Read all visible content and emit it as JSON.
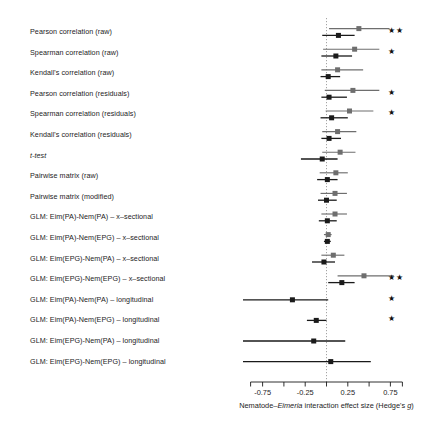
{
  "figure": {
    "xlabel_parts": [
      "Nematode–",
      "Eimeria",
      " interaction effect size (Hedge's ",
      "g",
      ")"
    ],
    "xlabel_full": "Nematode–Eimeria interaction effect size (Hedge's g)",
    "zero_line_value": 0,
    "series_colors": {
      "primary": "#1a1a1a",
      "secondary": "#6e6e6e"
    },
    "significance_glyph": "★"
  },
  "chart_data": {
    "type": "forest",
    "title": "",
    "xlabel": "Nematode–Eimeria interaction effect size (Hedge's g)",
    "ylabel": "",
    "xlim": [
      -0.98,
      0.98
    ],
    "xticks": [
      -0.75,
      -0.5,
      -0.25,
      0,
      0.25,
      0.5,
      0.75
    ],
    "xticklabels": [
      "-0.75",
      "",
      "-0.25",
      "",
      "0.25",
      "",
      "0.75"
    ],
    "grid": false,
    "zero_reference": 0,
    "legend": "none",
    "series": [
      {
        "name": "model A",
        "color": "#6e6e6e"
      },
      {
        "name": "model B",
        "color": "#1a1a1a"
      }
    ],
    "categories": [
      "Pearson correlation (raw)",
      "Spearman correlation (raw)",
      "Kendall's correlation (raw)",
      "Pearson correlation (residuals)",
      "Spearman correlation (residuals)",
      "Kendall's correlation (residuals)",
      "t-test",
      "Pairwise matrix (raw)",
      "Pairwise matrix (modified)",
      "GLM: Eim(PA)-Nem(PA) – x–sectional",
      "GLM: Eim(PA)-Nem(EPG) – x–sectional",
      "GLM: Eim(EPG)-Nem(PA) – x–sectional",
      "GLM: Eim(EPG)-Nem(EPG) – x–sectional",
      "GLM: Eim(PA)-Nem(PA) – longitudinal",
      "GLM: Eim(PA)-Nem(EPG) – longitudinal",
      "GLM: Eim(EPG)-Nem(PA) – longitudinal",
      "GLM: Eim(EPG)-Nem(EPG) – longitudinal"
    ],
    "rows": [
      {
        "label": "Pearson correlation (raw)",
        "italic": false,
        "estimates": [
          {
            "series": "model A",
            "value": 0.38,
            "lo": 0.03,
            "hi": 0.74
          },
          {
            "series": "model B",
            "value": 0.14,
            "lo": -0.05,
            "hi": 0.33
          }
        ],
        "significance": "★★"
      },
      {
        "label": "Spearman correlation (raw)",
        "italic": false,
        "estimates": [
          {
            "series": "model A",
            "value": 0.33,
            "lo": -0.04,
            "hi": 0.62
          },
          {
            "series": "model B",
            "value": 0.11,
            "lo": -0.06,
            "hi": 0.3
          }
        ],
        "significance": "★"
      },
      {
        "label": "Kendall's correlation (raw)",
        "italic": false,
        "estimates": [
          {
            "series": "model A",
            "value": 0.13,
            "lo": -0.06,
            "hi": 0.43
          },
          {
            "series": "model B",
            "value": 0.02,
            "lo": -0.07,
            "hi": 0.16
          }
        ],
        "significance": ""
      },
      {
        "label": "Pearson correlation (residuals)",
        "italic": false,
        "estimates": [
          {
            "series": "model A",
            "value": 0.31,
            "lo": -0.02,
            "hi": 0.62
          },
          {
            "series": "model B",
            "value": 0.03,
            "lo": -0.06,
            "hi": 0.24
          }
        ],
        "significance": "★"
      },
      {
        "label": "Spearman correlation (residuals)",
        "italic": false,
        "estimates": [
          {
            "series": "model A",
            "value": 0.27,
            "lo": -0.01,
            "hi": 0.55
          },
          {
            "series": "model B",
            "value": 0.06,
            "lo": -0.07,
            "hi": 0.25
          }
        ],
        "significance": "★"
      },
      {
        "label": "Kendall's correlation (residuals)",
        "italic": false,
        "estimates": [
          {
            "series": "model A",
            "value": 0.13,
            "lo": -0.05,
            "hi": 0.35
          },
          {
            "series": "model B",
            "value": 0.03,
            "lo": -0.06,
            "hi": 0.17
          }
        ],
        "significance": ""
      },
      {
        "label": "t-test",
        "italic": true,
        "estimates": [
          {
            "series": "model A",
            "value": 0.16,
            "lo": -0.05,
            "hi": 0.34
          },
          {
            "series": "model B",
            "value": -0.05,
            "lo": -0.3,
            "hi": 0.13
          }
        ],
        "significance": ""
      },
      {
        "label": "Pairwise matrix (raw)",
        "italic": false,
        "estimates": [
          {
            "series": "model A",
            "value": 0.11,
            "lo": -0.08,
            "hi": 0.25
          },
          {
            "series": "model B",
            "value": 0.01,
            "lo": -0.11,
            "hi": 0.13
          }
        ],
        "significance": ""
      },
      {
        "label": "Pairwise matrix (modified)",
        "italic": false,
        "estimates": [
          {
            "series": "model A",
            "value": 0.1,
            "lo": -0.07,
            "hi": 0.24
          },
          {
            "series": "model B",
            "value": 0.0,
            "lo": -0.1,
            "hi": 0.12
          }
        ],
        "significance": ""
      },
      {
        "label": "GLM: Eim(PA)-Nem(PA) – x–sectional",
        "italic": false,
        "estimates": [
          {
            "series": "model A",
            "value": 0.1,
            "lo": -0.06,
            "hi": 0.24
          },
          {
            "series": "model B",
            "value": 0.01,
            "lo": -0.09,
            "hi": 0.12
          }
        ],
        "significance": ""
      },
      {
        "label": "GLM: Eim(PA)-Nem(EPG) – x–sectional",
        "italic": false,
        "estimates": [
          {
            "series": "model A",
            "value": 0.02,
            "lo": -0.03,
            "hi": 0.06
          },
          {
            "series": "model B",
            "value": 0.01,
            "lo": -0.03,
            "hi": 0.05
          }
        ],
        "significance": ""
      },
      {
        "label": "GLM: Eim(EPG)-Nem(PA) – x–sectional",
        "italic": false,
        "estimates": [
          {
            "series": "model A",
            "value": 0.08,
            "lo": -0.06,
            "hi": 0.21
          },
          {
            "series": "model B",
            "value": -0.03,
            "lo": -0.17,
            "hi": 0.1
          }
        ],
        "significance": ""
      },
      {
        "label": "GLM: Eim(EPG)-Nem(EPG) – x–sectional",
        "italic": false,
        "estimates": [
          {
            "series": "model A",
            "value": 0.44,
            "lo": 0.13,
            "hi": 0.79
          },
          {
            "series": "model B",
            "value": 0.18,
            "lo": 0.02,
            "hi": 0.33
          }
        ],
        "significance": "★★"
      },
      {
        "label": "GLM: Eim(PA)-Nem(PA) – longitudinal",
        "italic": false,
        "estimates": [
          {
            "series": "model B",
            "value": -0.4,
            "lo": -0.98,
            "hi": 0.02
          }
        ],
        "significance": "★"
      },
      {
        "label": "GLM: Eim(PA)-Nem(EPG) – longitudinal",
        "italic": false,
        "estimates": [
          {
            "series": "model B",
            "value": -0.12,
            "lo": -0.23,
            "hi": 0.0
          }
        ],
        "significance": "★"
      },
      {
        "label": "GLM: Eim(EPG)-Nem(PA) – longitudinal",
        "italic": false,
        "estimates": [
          {
            "series": "model B",
            "value": -0.15,
            "lo": -0.98,
            "hi": 0.22
          }
        ],
        "significance": ""
      },
      {
        "label": "GLM: Eim(EPG)-Nem(EPG) – longitudinal",
        "italic": false,
        "estimates": [
          {
            "series": "model B",
            "value": 0.05,
            "lo": -0.98,
            "hi": 0.52
          }
        ],
        "significance": ""
      }
    ]
  }
}
